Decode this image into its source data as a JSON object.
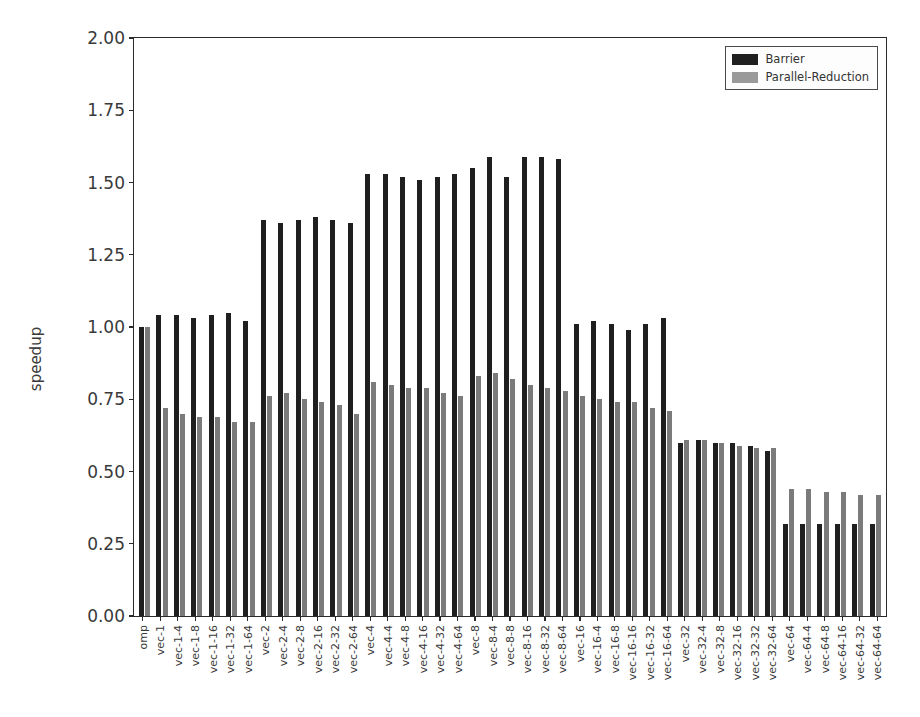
{
  "chart_data": {
    "type": "bar",
    "title": "",
    "xlabel": "",
    "ylabel": "speedup",
    "ylim": [
      0.0,
      2.0
    ],
    "yticks": [
      "0.00",
      "0.25",
      "0.50",
      "0.75",
      "1.00",
      "1.25",
      "1.50",
      "1.75",
      "2.00"
    ],
    "ytick_values": [
      0.0,
      0.25,
      0.5,
      0.75,
      1.0,
      1.25,
      1.5,
      1.75,
      2.0
    ],
    "grid": false,
    "legend_position": "upper right",
    "categories": [
      "omp",
      "vec-1",
      "vec-1-4",
      "vec-1-8",
      "vec-1-16",
      "vec-1-32",
      "vec-1-64",
      "vec-2",
      "vec-2-4",
      "vec-2-8",
      "vec-2-16",
      "vec-2-32",
      "vec-2-64",
      "vec-4",
      "vec-4-4",
      "vec-4-8",
      "vec-4-16",
      "vec-4-32",
      "vec-4-64",
      "vec-8",
      "vec-8-4",
      "vec-8-8",
      "vec-8-16",
      "vec-8-32",
      "vec-8-64",
      "vec-16",
      "vec-16-4",
      "vec-16-8",
      "vec-16-16",
      "vec-16-32",
      "vec-16-64",
      "vec-32",
      "vec-32-4",
      "vec-32-8",
      "vec-32-16",
      "vec-32-32",
      "vec-32-64",
      "vec-64",
      "vec-64-4",
      "vec-64-8",
      "vec-64-16",
      "vec-64-32",
      "vec-64-64"
    ],
    "series": [
      {
        "name": "Barrier",
        "color": "#1f1f1f",
        "values": [
          1.0,
          1.04,
          1.04,
          1.03,
          1.04,
          1.05,
          1.02,
          1.37,
          1.36,
          1.37,
          1.38,
          1.37,
          1.36,
          1.53,
          1.53,
          1.52,
          1.51,
          1.52,
          1.53,
          1.55,
          1.59,
          1.52,
          1.59,
          1.59,
          1.58,
          1.01,
          1.02,
          1.01,
          0.99,
          1.01,
          1.03,
          0.6,
          0.61,
          0.6,
          0.6,
          0.59,
          0.57,
          0.32,
          0.32,
          0.32,
          0.32,
          0.32,
          0.32
        ]
      },
      {
        "name": "Parallel-Reduction",
        "color": "#7b7b7b",
        "values": [
          1.0,
          0.72,
          0.7,
          0.69,
          0.69,
          0.67,
          0.67,
          0.76,
          0.77,
          0.75,
          0.74,
          0.73,
          0.7,
          0.81,
          0.8,
          0.79,
          0.79,
          0.77,
          0.76,
          0.83,
          0.84,
          0.82,
          0.8,
          0.79,
          0.78,
          0.76,
          0.75,
          0.74,
          0.74,
          0.72,
          0.71,
          0.61,
          0.61,
          0.6,
          0.59,
          0.58,
          0.58,
          0.44,
          0.44,
          0.43,
          0.43,
          0.42,
          0.42
        ]
      }
    ]
  },
  "legend": {
    "items": [
      {
        "label": "Barrier",
        "color": "#1f1f1f"
      },
      {
        "label": "Parallel-Reduction",
        "color": "#9a9a9a"
      }
    ]
  }
}
